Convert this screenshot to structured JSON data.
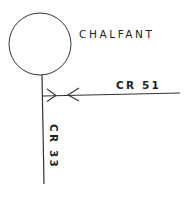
{
  "map": {
    "place": {
      "name": "CHALFANT",
      "marker": "circle-town-marker"
    },
    "roads": [
      {
        "id": "cr51",
        "label": "CR 51",
        "orientation": "horizontal"
      },
      {
        "id": "cr33",
        "label": "CR 33",
        "orientation": "vertical"
      }
    ],
    "junction": {
      "markers": [
        "arrow-right-icon",
        "arrow-left-icon"
      ]
    },
    "colors": {
      "ink": "#333333",
      "background": "#ffffff"
    }
  }
}
